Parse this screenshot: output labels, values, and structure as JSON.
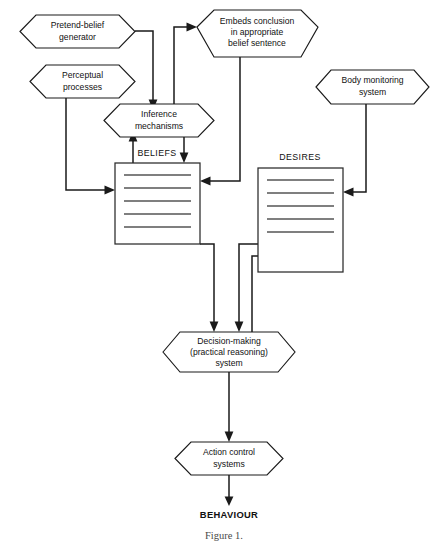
{
  "figure": {
    "caption": "Figure 1.",
    "background_color": "#ffffff",
    "line_color": "#1a1a1a"
  },
  "nodes": {
    "pretend_belief": {
      "line1": "Pretend-belief",
      "line2": "generator"
    },
    "perceptual": {
      "line1": "Perceptual",
      "line2": "processes"
    },
    "embeds": {
      "line1": "Embeds conclusion",
      "line2": "in appropriate",
      "line3": "belief sentence"
    },
    "body_monitoring": {
      "line1": "Body monitoring",
      "line2": "system"
    },
    "inference": {
      "line1": "Inference",
      "line2": "mechanisms"
    },
    "decision": {
      "line1": "Decision-making",
      "line2": "(practical reasoning)",
      "line3": "system"
    },
    "action_control": {
      "line1": "Action control",
      "line2": "systems"
    }
  },
  "stores": {
    "beliefs": {
      "title": "BELIEFS",
      "rule_count": 5
    },
    "desires": {
      "title": "DESIRES",
      "rule_count": 5
    }
  },
  "terminal": {
    "behaviour": "BEHAVIOUR"
  }
}
